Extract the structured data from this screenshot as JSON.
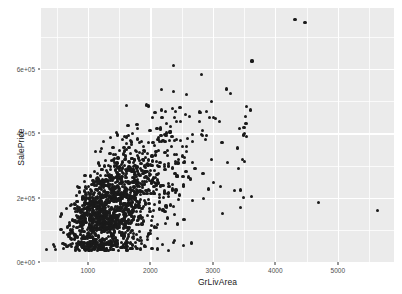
{
  "chart_data": {
    "type": "scatter",
    "title": "",
    "subtitle": "",
    "xlabel": "GrLivArea",
    "ylabel": "SalePrice",
    "xlim": [
      250,
      5900
    ],
    "ylim": [
      0,
      790000
    ],
    "x_ticks": [
      1000,
      2000,
      3000,
      4000,
      5000
    ],
    "x_tick_labels": [
      "1000",
      "2000",
      "3000",
      "4000",
      "5000"
    ],
    "x_minor_ticks": [
      500,
      1500,
      2500,
      3500,
      4500,
      5500
    ],
    "y_ticks": [
      0,
      200000,
      400000,
      600000
    ],
    "y_tick_labels": [
      "0e+00",
      "2e+05",
      "4e+05",
      "6e+05"
    ],
    "y_minor_ticks": [
      100000,
      300000,
      500000,
      700000
    ],
    "grid": true,
    "legend": null,
    "point_color": "#1a1a1a",
    "point_size": 3.2,
    "panel_background": "#ebebeb",
    "grid_color": "#ffffff",
    "n_points": 1460,
    "notable_points": [
      {
        "x": 4316,
        "y": 755000,
        "note": "high outlier"
      },
      {
        "x": 4476,
        "y": 745000,
        "note": "high outlier"
      },
      {
        "x": 3627,
        "y": 625000,
        "note": "high outlier"
      },
      {
        "x": 2376,
        "y": 611657,
        "note": "high price"
      },
      {
        "x": 2822,
        "y": 582933,
        "note": "high price"
      },
      {
        "x": 3222,
        "y": 538000,
        "note": "high price"
      },
      {
        "x": 4692,
        "y": 186000,
        "note": "large area low price outlier"
      },
      {
        "x": 5642,
        "y": 160000,
        "note": "largest area low price outlier"
      },
      {
        "x": 3493,
        "y": 200000,
        "note": "large area outlier"
      },
      {
        "x": 1476,
        "y": 395000,
        "note": "small area high price"
      },
      {
        "x": 334,
        "y": 39300,
        "note": "lowest area"
      },
      {
        "x": 480,
        "y": 37900,
        "note": "low price"
      }
    ],
    "series": [
      {
        "name": "Ames housing",
        "n": 1460,
        "x_range": [
          334,
          5642
        ],
        "y_range": [
          34900,
          755000
        ],
        "correlation": 0.71,
        "description": "SalePrice increases with GrLivArea; dense cluster between 900-2000 sq ft and $100k-$250k with fan-out variance at higher areas"
      }
    ]
  },
  "axis": {
    "x_title": "GrLivArea",
    "y_title": "SalePrice"
  }
}
